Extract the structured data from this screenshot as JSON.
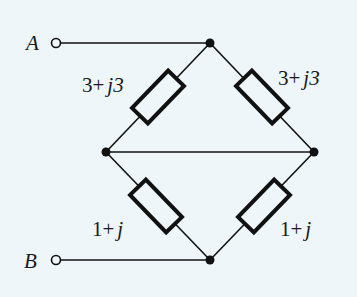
{
  "diagram": {
    "type": "circuit",
    "terminals": [
      {
        "id": "A",
        "label": "A"
      },
      {
        "id": "B",
        "label": "B"
      }
    ],
    "impedances": [
      {
        "id": "Z1",
        "position": "upper-left",
        "real": "3",
        "imag": "3",
        "text_real": "3+",
        "text_imag": "j3"
      },
      {
        "id": "Z2",
        "position": "upper-right",
        "real": "3",
        "imag": "3",
        "text_real": "3+",
        "text_imag": "j3"
      },
      {
        "id": "Z3",
        "position": "lower-left",
        "real": "1",
        "imag": "1",
        "text_real": "1+",
        "text_imag": "j"
      },
      {
        "id": "Z4",
        "position": "lower-right",
        "real": "1",
        "imag": "1",
        "text_real": "1+",
        "text_imag": "j"
      }
    ],
    "connections": "A to top node; B to bottom node; left and right nodes shorted by horizontal wire"
  }
}
